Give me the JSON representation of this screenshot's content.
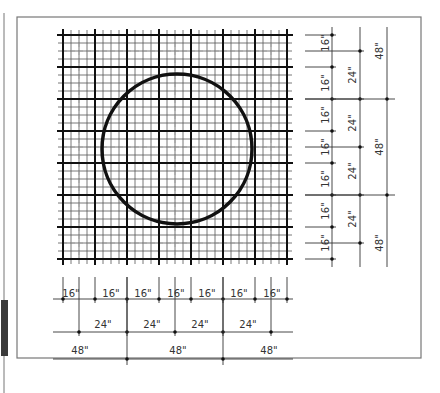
{
  "diagram": {
    "colors": {
      "ink": "#111111",
      "thin_line": "#555555",
      "dim_line": "#333333",
      "frame": "#777777",
      "side_bar": "#3a3a3a"
    },
    "grid": {
      "major_spacing_in": 16,
      "minor_spacing_in": 4,
      "dashed_spacing_in": 24,
      "extent_in": 112
    },
    "circle": {
      "center_in": [
        57,
        57
      ],
      "radius_in": 37.5
    },
    "bottom_dimensions": {
      "row_16": [
        "16\"",
        "16\"",
        "16\"",
        "16\"",
        "16\"",
        "16\"",
        "16\""
      ],
      "row_24": [
        "24\"",
        "24\"",
        "24\"",
        "24\""
      ],
      "row_48": [
        "48\"",
        "48\"",
        "48\""
      ]
    },
    "right_dimensions": {
      "col_16": [
        "16\"",
        "16\"",
        "16\"",
        "16\"",
        "16\"",
        "16\"",
        "16\""
      ],
      "col_24": [
        "24\"",
        "24\"",
        "24\"",
        "24\""
      ],
      "col_48": [
        "48\"",
        "48\"",
        "48\""
      ]
    }
  }
}
